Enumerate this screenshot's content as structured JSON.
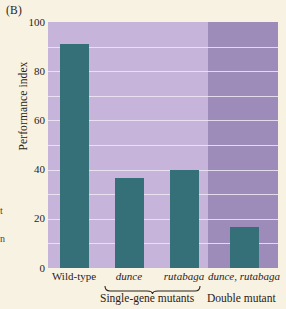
{
  "panel": {
    "letter": "(B)"
  },
  "bleed_fragments": {
    "one": "t",
    "two": "n"
  },
  "chart_data": {
    "type": "bar",
    "title": "",
    "xlabel": "",
    "ylabel": "Performance index",
    "ylim": [
      0,
      100
    ],
    "yticks": [
      0,
      20,
      40,
      60,
      80,
      100
    ],
    "ytick_labels": [
      "0",
      "20",
      "40",
      "60",
      "80",
      "100"
    ],
    "grid": true,
    "legend": "none",
    "categories": [
      "Wild-type",
      "dunce",
      "rutabaga",
      "dunce, rutabaga"
    ],
    "category_styles": [
      "normal",
      "italic",
      "italic",
      "italic"
    ],
    "values": [
      91,
      36.5,
      40,
      16.5
    ],
    "bar_color": "#357078",
    "panel_colors": {
      "light": "#c6b4da",
      "dark": "#9d8bba"
    },
    "groups": [
      {
        "label": "Single-gene mutants",
        "members": [
          "dunce",
          "rutabaga"
        ],
        "brace": true
      },
      {
        "label": "Double mutant",
        "members": [
          "dunce, rutabaga"
        ],
        "brace": false
      }
    ]
  }
}
